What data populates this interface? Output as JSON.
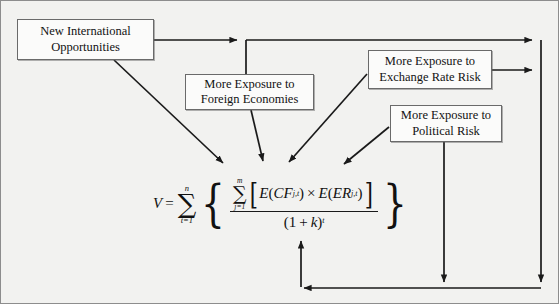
{
  "figure": {
    "background_color": "#f2f2f0",
    "border_color": "#8d8d8d",
    "line_color": "#1a1a1a"
  },
  "nodes": [
    {
      "id": "new-international-opportunities",
      "label": "New International\nOpportunities",
      "x": 16,
      "y": 18,
      "w": 137,
      "h": 41
    },
    {
      "id": "more-exposure-foreign-economies",
      "label": "More Exposure to\nForeign Economies",
      "x": 184,
      "y": 73,
      "w": 129,
      "h": 36
    },
    {
      "id": "more-exposure-exchange-rate-risk",
      "label": "More Exposure to\nExchange Rate Risk",
      "x": 367,
      "y": 49,
      "w": 124,
      "h": 39
    },
    {
      "id": "more-exposure-political-risk",
      "label": "More Exposure to\nPolitical Risk",
      "x": 389,
      "y": 104,
      "w": 112,
      "h": 37
    }
  ],
  "formula": {
    "id": "valuation-formula",
    "plain_text": "V = sum_{t=1}^{n} { ( sum_{j=1}^{m} [ E(CF_j,t) x E(ER_j,t) ] ) / (1 + k)^t }",
    "lhs_variable": "V",
    "equals": "=",
    "outer_sum": {
      "symbol": "∑",
      "lower": "t=1",
      "upper": "n"
    },
    "inner_sum": {
      "symbol": "∑",
      "lower": "j=1",
      "upper": "m"
    },
    "numerator": {
      "open_bracket": "[",
      "term_one": {
        "fn": "E",
        "open": "(",
        "base": "CF",
        "sub": "j,t",
        "close": ")"
      },
      "operator": "×",
      "term_two": {
        "fn": "E",
        "open": "(",
        "base": "ER",
        "sub": "j,t",
        "close": ")"
      },
      "close_bracket": "]"
    },
    "denominator": {
      "open": "(",
      "one": "1",
      "plus": "+",
      "k": "k",
      "close": ")",
      "exponent": "t"
    },
    "left_brace": "{",
    "right_brace": "}"
  },
  "connectors": [
    {
      "id": "opportunities-to-right-rail",
      "from": "new-international-opportunities",
      "to": "right-rail",
      "style": "orthogonal-arrow"
    },
    {
      "id": "opportunities-to-foreign-economies",
      "from": "new-international-opportunities",
      "to": "more-exposure-foreign-economies",
      "style": "branch-down"
    },
    {
      "id": "opportunities-to-numerator",
      "from": "new-international-opportunities",
      "to": "valuation-formula-numerator",
      "style": "diagonal-arrow"
    },
    {
      "id": "foreign-economies-to-numerator",
      "from": "more-exposure-foreign-economies",
      "to": "valuation-formula-numerator",
      "style": "diagonal-arrow"
    },
    {
      "id": "exchange-rate-risk-to-numerator",
      "from": "more-exposure-exchange-rate-risk",
      "to": "valuation-formula-numerator",
      "style": "diagonal-arrow"
    },
    {
      "id": "exchange-rate-risk-to-right-rail",
      "from": "more-exposure-exchange-rate-risk",
      "to": "right-rail",
      "style": "horizontal-arrow"
    },
    {
      "id": "political-risk-to-numerator",
      "from": "more-exposure-political-risk",
      "to": "valuation-formula-numerator",
      "style": "diagonal-arrow"
    },
    {
      "id": "political-risk-to-bottom-rail",
      "from": "more-exposure-political-risk",
      "to": "bottom-rail",
      "style": "vertical-arrow"
    },
    {
      "id": "right-rail-to-denominator",
      "from": "right-rail",
      "to": "valuation-formula-denominator",
      "style": "orthogonal-feedback-arrow"
    }
  ]
}
